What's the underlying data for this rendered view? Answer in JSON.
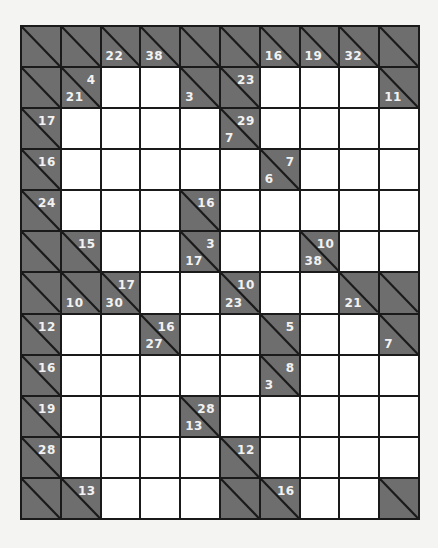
{
  "puzzle": {
    "type": "kakuro",
    "rows": 12,
    "cols": 10,
    "colors": {
      "clue_fill": "#6e6e6e",
      "white_fill": "#ffffff",
      "grid_line": "#1a1a1a",
      "clue_text": "#f2f2f2"
    },
    "grid": [
      [
        {
          "t": "c"
        },
        {
          "t": "c"
        },
        {
          "t": "c",
          "d": "22"
        },
        {
          "t": "c",
          "d": "38"
        },
        {
          "t": "c"
        },
        {
          "t": "c"
        },
        {
          "t": "c",
          "d": "16"
        },
        {
          "t": "c",
          "d": "19"
        },
        {
          "t": "c",
          "d": "32"
        },
        {
          "t": "c"
        }
      ],
      [
        {
          "t": "c"
        },
        {
          "t": "c",
          "d": "21",
          "r": "4"
        },
        {
          "t": "w"
        },
        {
          "t": "w"
        },
        {
          "t": "c",
          "d": "3"
        },
        {
          "t": "c",
          "r": "23"
        },
        {
          "t": "w"
        },
        {
          "t": "w"
        },
        {
          "t": "w"
        },
        {
          "t": "c",
          "d": "11"
        }
      ],
      [
        {
          "t": "c",
          "r": "17"
        },
        {
          "t": "w"
        },
        {
          "t": "w"
        },
        {
          "t": "w"
        },
        {
          "t": "w"
        },
        {
          "t": "c",
          "d": "7",
          "r": "29"
        },
        {
          "t": "w"
        },
        {
          "t": "w"
        },
        {
          "t": "w"
        },
        {
          "t": "w"
        }
      ],
      [
        {
          "t": "c",
          "r": "16"
        },
        {
          "t": "w"
        },
        {
          "t": "w"
        },
        {
          "t": "w"
        },
        {
          "t": "w"
        },
        {
          "t": "w"
        },
        {
          "t": "c",
          "d": "6",
          "r": "7"
        },
        {
          "t": "w"
        },
        {
          "t": "w"
        },
        {
          "t": "w"
        }
      ],
      [
        {
          "t": "c",
          "r": "24"
        },
        {
          "t": "w"
        },
        {
          "t": "w"
        },
        {
          "t": "w"
        },
        {
          "t": "c",
          "r": "16"
        },
        {
          "t": "w"
        },
        {
          "t": "w"
        },
        {
          "t": "w"
        },
        {
          "t": "w"
        },
        {
          "t": "w"
        }
      ],
      [
        {
          "t": "c"
        },
        {
          "t": "c",
          "r": "15"
        },
        {
          "t": "w"
        },
        {
          "t": "w"
        },
        {
          "t": "c",
          "d": "17",
          "r": "3"
        },
        {
          "t": "w"
        },
        {
          "t": "w"
        },
        {
          "t": "c",
          "d": "38",
          "r": "10"
        },
        {
          "t": "w"
        },
        {
          "t": "w"
        }
      ],
      [
        {
          "t": "c"
        },
        {
          "t": "c",
          "d": "10"
        },
        {
          "t": "c",
          "d": "30",
          "r": "17"
        },
        {
          "t": "w"
        },
        {
          "t": "w"
        },
        {
          "t": "c",
          "d": "23",
          "r": "10"
        },
        {
          "t": "w"
        },
        {
          "t": "w"
        },
        {
          "t": "c",
          "d": "21"
        },
        {
          "t": "c"
        }
      ],
      [
        {
          "t": "c",
          "r": "12"
        },
        {
          "t": "w"
        },
        {
          "t": "w"
        },
        {
          "t": "c",
          "d": "27",
          "r": "16"
        },
        {
          "t": "w"
        },
        {
          "t": "w"
        },
        {
          "t": "c",
          "r": "5"
        },
        {
          "t": "w"
        },
        {
          "t": "w"
        },
        {
          "t": "c",
          "d": "7"
        }
      ],
      [
        {
          "t": "c",
          "r": "16"
        },
        {
          "t": "w"
        },
        {
          "t": "w"
        },
        {
          "t": "w"
        },
        {
          "t": "w"
        },
        {
          "t": "w"
        },
        {
          "t": "c",
          "d": "3",
          "r": "8"
        },
        {
          "t": "w"
        },
        {
          "t": "w"
        },
        {
          "t": "w"
        }
      ],
      [
        {
          "t": "c",
          "r": "19"
        },
        {
          "t": "w"
        },
        {
          "t": "w"
        },
        {
          "t": "w"
        },
        {
          "t": "c",
          "d": "13",
          "r": "28"
        },
        {
          "t": "w"
        },
        {
          "t": "w"
        },
        {
          "t": "w"
        },
        {
          "t": "w"
        },
        {
          "t": "w"
        }
      ],
      [
        {
          "t": "c",
          "r": "28"
        },
        {
          "t": "w"
        },
        {
          "t": "w"
        },
        {
          "t": "w"
        },
        {
          "t": "w"
        },
        {
          "t": "c",
          "r": "12"
        },
        {
          "t": "w"
        },
        {
          "t": "w"
        },
        {
          "t": "w"
        },
        {
          "t": "w"
        }
      ],
      [
        {
          "t": "c"
        },
        {
          "t": "c",
          "r": "13"
        },
        {
          "t": "w"
        },
        {
          "t": "w"
        },
        {
          "t": "w"
        },
        {
          "t": "c"
        },
        {
          "t": "c",
          "r": "16"
        },
        {
          "t": "w"
        },
        {
          "t": "w"
        },
        {
          "t": "c"
        }
      ]
    ]
  }
}
